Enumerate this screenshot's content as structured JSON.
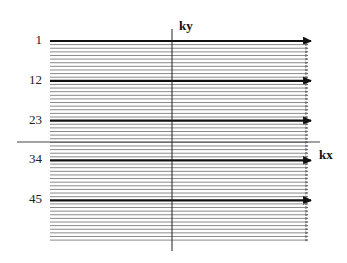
{
  "diagram": {
    "type": "k-space line-by-line (Cartesian) trajectory",
    "axes": {
      "vertical_label": "ky",
      "horizontal_label": "kx"
    },
    "lines": {
      "count": 56,
      "first_y": 41,
      "spacing": 3.62,
      "x_start": 50,
      "x_end": 308,
      "thin_color": "#8a8a8a",
      "thick_color": "#111111"
    },
    "highlighted_rows": [
      {
        "index": 1,
        "label": "1"
      },
      {
        "index": 12,
        "label": "12"
      },
      {
        "index": 23,
        "label": "23"
      },
      {
        "index": 34,
        "label": "34"
      },
      {
        "index": 45,
        "label": "45"
      }
    ]
  }
}
